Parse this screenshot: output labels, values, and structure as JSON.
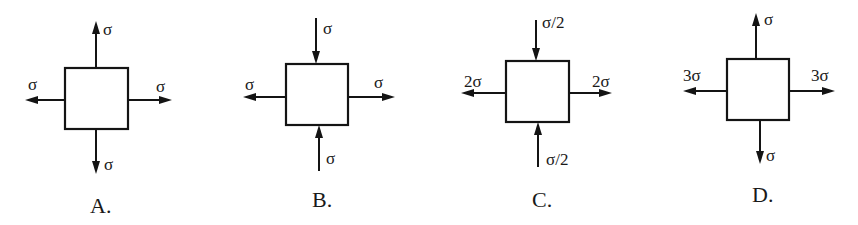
{
  "colors": {
    "ink": "#141414",
    "background": "#ffffff"
  },
  "options": [
    {
      "label": "A.",
      "label_pos": [
        90,
        213
      ],
      "box": {
        "x": 65,
        "y": 68,
        "w": 63,
        "h": 61
      },
      "arrows": [
        {
          "side": "top",
          "direction": "outward",
          "x1": 96,
          "y1": 68,
          "x2": 96,
          "y2": 21,
          "text": "σ",
          "tx": 103,
          "ty": 35
        },
        {
          "side": "bottom",
          "direction": "outward",
          "x1": 96,
          "y1": 129,
          "x2": 96,
          "y2": 174,
          "text": "σ",
          "tx": 104,
          "ty": 170
        },
        {
          "side": "left",
          "direction": "outward",
          "x1": 65,
          "y1": 100,
          "x2": 25,
          "y2": 100,
          "text": "σ",
          "tx": 28,
          "ty": 90
        },
        {
          "side": "right",
          "direction": "outward",
          "x1": 128,
          "y1": 100,
          "x2": 172,
          "y2": 100,
          "text": "σ",
          "tx": 156,
          "ty": 92
        }
      ]
    },
    {
      "label": "B.",
      "label_pos": [
        312,
        207
      ],
      "box": {
        "x": 286,
        "y": 64,
        "w": 62,
        "h": 61
      },
      "arrows": [
        {
          "side": "top",
          "direction": "inward",
          "x1": 316,
          "y1": 18,
          "x2": 316,
          "y2": 64,
          "text": "σ",
          "tx": 323,
          "ty": 34
        },
        {
          "side": "bottom",
          "direction": "inward",
          "x1": 319,
          "y1": 171,
          "x2": 319,
          "y2": 125,
          "text": "σ",
          "tx": 326,
          "ty": 164
        },
        {
          "side": "left",
          "direction": "outward",
          "x1": 286,
          "y1": 97,
          "x2": 243,
          "y2": 97,
          "text": "σ",
          "tx": 245,
          "ty": 90
        },
        {
          "side": "right",
          "direction": "outward",
          "x1": 348,
          "y1": 97,
          "x2": 395,
          "y2": 97,
          "text": "σ",
          "tx": 374,
          "ty": 88
        }
      ]
    },
    {
      "label": "C.",
      "label_pos": [
        532,
        207
      ],
      "box": {
        "x": 506,
        "y": 61,
        "w": 63,
        "h": 61
      },
      "arrows": [
        {
          "side": "top",
          "direction": "inward",
          "x1": 536,
          "y1": 20,
          "x2": 536,
          "y2": 61,
          "text": "σ/2",
          "tx": 542,
          "ty": 28
        },
        {
          "side": "bottom",
          "direction": "inward",
          "x1": 538,
          "y1": 167,
          "x2": 538,
          "y2": 122,
          "text": "σ/2",
          "tx": 546,
          "ty": 165
        },
        {
          "side": "left",
          "direction": "outward",
          "x1": 506,
          "y1": 93,
          "x2": 461,
          "y2": 93,
          "text": "2σ",
          "tx": 464,
          "ty": 87
        },
        {
          "side": "right",
          "direction": "outward",
          "x1": 569,
          "y1": 93,
          "x2": 612,
          "y2": 93,
          "text": "2σ",
          "tx": 592,
          "ty": 87
        }
      ]
    },
    {
      "label": "D.",
      "label_pos": [
        752,
        202
      ],
      "box": {
        "x": 727,
        "y": 59,
        "w": 62,
        "h": 61
      },
      "arrows": [
        {
          "side": "top",
          "direction": "outward",
          "x1": 756,
          "y1": 59,
          "x2": 756,
          "y2": 13,
          "text": "σ",
          "tx": 764,
          "ty": 25
        },
        {
          "side": "bottom",
          "direction": "outward",
          "x1": 760,
          "y1": 120,
          "x2": 760,
          "y2": 164,
          "text": "σ",
          "tx": 766,
          "ty": 161
        },
        {
          "side": "left",
          "direction": "outward",
          "x1": 727,
          "y1": 91,
          "x2": 683,
          "y2": 91,
          "text": "3σ",
          "tx": 683,
          "ty": 81
        },
        {
          "side": "right",
          "direction": "outward",
          "x1": 789,
          "y1": 91,
          "x2": 835,
          "y2": 91,
          "text": "3σ",
          "tx": 811,
          "ty": 81
        }
      ]
    }
  ]
}
